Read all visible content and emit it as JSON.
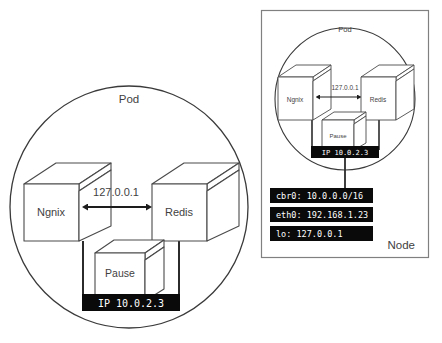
{
  "diagram": {
    "colors": {
      "outline": "#3a3a3a",
      "cube_stroke": "#4a4a4a",
      "panel_border": "#808080",
      "bar_background": "#0a0a0a",
      "bar_text": "#ffffff",
      "background": "#ffffff"
    },
    "left_panel": {
      "name": "pod-detail-view",
      "pod_label": "Pod",
      "containers": [
        {
          "id": "ngnix",
          "label": "Ngnix"
        },
        {
          "id": "redis",
          "label": "Redis"
        },
        {
          "id": "pause",
          "label": "Pause"
        }
      ],
      "loopback_label": "127.0.0.1",
      "ip_bar_label": "IP 10.0.2.3"
    },
    "right_panel": {
      "name": "node-overview",
      "node_label": "Node",
      "pod_label": "Pod",
      "containers": [
        {
          "id": "ngnix",
          "label": "Ngnix"
        },
        {
          "id": "redis",
          "label": "Redis"
        },
        {
          "id": "pause",
          "label": "Pause"
        }
      ],
      "loopback_label": "127.0.0.1",
      "ip_bar_label": "IP 10.0.2.3",
      "interfaces": [
        {
          "id": "cbr0",
          "label": "cbr0: 10.0.0.0/16"
        },
        {
          "id": "eth0",
          "label": "eth0: 192.168.1.23"
        },
        {
          "id": "lo",
          "label": "lo: 127.0.0.1"
        }
      ]
    }
  }
}
